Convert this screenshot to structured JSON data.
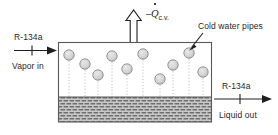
{
  "diagram": {
    "inlet": {
      "fluid_label": "R-134a",
      "state_label": "Vapor in",
      "arrow_direction": "right"
    },
    "outlet": {
      "fluid_label": "R-134a",
      "state_label": "Liquid out",
      "arrow_direction": "right"
    },
    "heat_transfer": {
      "minus_sign": "–",
      "symbol": "Q",
      "subscript": "c.v.",
      "arrow_direction": "up",
      "arrow_style": "hollow-outline"
    },
    "callout": {
      "label": "Cold water pipes",
      "pointer": "leader-line"
    },
    "colors": {
      "outline": "#595959",
      "pipe_fill": "#d4d4d4",
      "pipe_stroke": "#8a8a8a",
      "liquid_fill": "#c9c9c9",
      "liquid_hatch": "#6e6e6e",
      "vapor_fill": "#ffffff",
      "text": "#1f1f1f",
      "dotted_line": "#b5b5b5"
    },
    "vessel": {
      "x": 58,
      "y": 42,
      "width": 154,
      "height": 80,
      "liquid_level_y": 97
    },
    "pipes": [
      {
        "cx": 69,
        "cy": 55,
        "r": 5.2,
        "drop_to": 97
      },
      {
        "cx": 85,
        "cy": 64,
        "r": 5.2,
        "drop_to": 97
      },
      {
        "cx": 98,
        "cy": 75,
        "r": 5.2,
        "drop_to": 97
      },
      {
        "cx": 112,
        "cy": 56,
        "r": 5.2,
        "drop_to": 97
      },
      {
        "cx": 127,
        "cy": 69,
        "r": 5.2,
        "drop_to": 97
      },
      {
        "cx": 143,
        "cy": 54,
        "r": 5.2,
        "drop_to": 97
      },
      {
        "cx": 160,
        "cy": 79,
        "r": 5.2,
        "drop_to": 97
      },
      {
        "cx": 173,
        "cy": 65,
        "r": 5.2,
        "drop_to": 97
      },
      {
        "cx": 189,
        "cy": 53,
        "r": 5.2,
        "drop_to": 97
      },
      {
        "cx": 203,
        "cy": 72,
        "r": 5.2,
        "drop_to": 97
      }
    ]
  }
}
